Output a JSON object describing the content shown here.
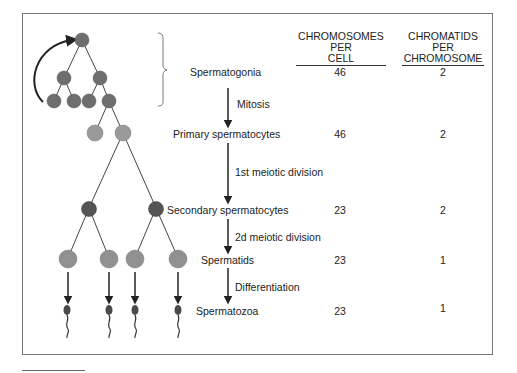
{
  "header": {
    "col1": {
      "line1": "CHROMOSOMES",
      "line2": "PER",
      "line3": "CELL"
    },
    "col2": {
      "line1": "CHROMATIDS",
      "line2": "PER",
      "line3": "CHROMOSOME"
    }
  },
  "stages": [
    {
      "label": "Spermatogonia",
      "chromosomes_per_cell": "46",
      "chromatids_per_chromosome": "2"
    },
    {
      "label": "Primary spermatocytes",
      "chromosomes_per_cell": "46",
      "chromatids_per_chromosome": "2"
    },
    {
      "label": "Secondary spermatocytes",
      "chromosomes_per_cell": "23",
      "chromatids_per_chromosome": "2"
    },
    {
      "label": "Spermatids",
      "chromosomes_per_cell": "23",
      "chromatids_per_chromosome": "1"
    },
    {
      "label": "Spermatozoa",
      "chromosomes_per_cell": "23",
      "chromatids_per_chromosome": "1"
    }
  ],
  "transitions": [
    {
      "label": "Mitosis"
    },
    {
      "label": "1st meiotic division"
    },
    {
      "label": "2d meiotic division"
    },
    {
      "label": "Differentiation"
    }
  ],
  "colors": {
    "spermatogonia_cell": "#6e6e6e",
    "primary_cell": "#9a9a9a",
    "secondary_cell": "#555555",
    "spermatid_cell": "#909090",
    "sperm": "#4a4a4a",
    "line": "#333333"
  }
}
